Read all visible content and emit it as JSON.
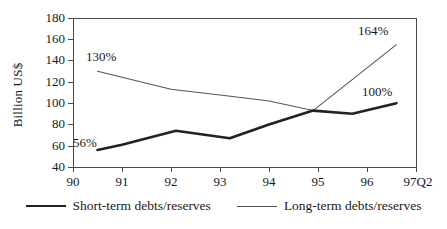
{
  "chart_data": {
    "type": "line",
    "title": "",
    "xlabel": "",
    "ylabel": "Billion US$",
    "ylim": [
      40,
      180
    ],
    "ytick_labels": [
      "180",
      "160",
      "140",
      "120",
      "100",
      "80",
      "60",
      "40"
    ],
    "ytick_values": [
      180,
      160,
      140,
      120,
      100,
      80,
      60,
      40
    ],
    "xtick_labels": [
      "90",
      "91",
      "92",
      "93",
      "94",
      "95",
      "96",
      "97Q2"
    ],
    "xtick_values": [
      90,
      91,
      92,
      93,
      94,
      95,
      96,
      97
    ],
    "grid": false,
    "legend_position": "bottom",
    "series": [
      {
        "name": "Short-term debts/reserves",
        "color": "#222222",
        "x": [
          90.5,
          91.0,
          92.1,
          93.2,
          94.0,
          94.9,
          95.7,
          96.6
        ],
        "values": [
          56,
          61,
          74,
          67,
          80,
          93,
          90,
          100
        ]
      },
      {
        "name": "Long-term debts/reserves",
        "color": "#555555",
        "x": [
          90.5,
          92.0,
          93.3,
          94.0,
          94.9,
          96.6
        ],
        "values": [
          130,
          113,
          106,
          102,
          93,
          155
        ]
      }
    ],
    "annotations": [
      {
        "text": "130%",
        "series": "Long-term debts/reserves",
        "x": 90.5,
        "value": 130
      },
      {
        "text": "56%",
        "series": "Short-term debts/reserves",
        "x": 90.5,
        "value": 56
      },
      {
        "text": "164%",
        "series": "Long-term debts/reserves",
        "x": 96.6,
        "value": 155
      },
      {
        "text": "100%",
        "series": "Short-term debts/reserves",
        "x": 96.6,
        "value": 100
      }
    ]
  },
  "legend": {
    "items": [
      {
        "label": "Short-term debts/reserves"
      },
      {
        "label": "Long-term debts/reserves"
      }
    ]
  }
}
